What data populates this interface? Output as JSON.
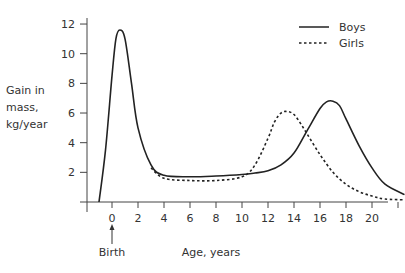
{
  "chart_data": {
    "type": "line",
    "title": "",
    "xlabel": "Age, years",
    "ylabel": "Gain in mass, kg/year",
    "ylabel_lines": [
      "Gain in",
      "mass,",
      "kg/year"
    ],
    "xlim": [
      -2,
      23
    ],
    "ylim": [
      0,
      12
    ],
    "x_ticks": [
      0,
      2,
      4,
      6,
      8,
      10,
      12,
      14,
      16,
      18,
      20
    ],
    "y_ticks": [
      2,
      4,
      6,
      8,
      10,
      12
    ],
    "grid": false,
    "legend_position": "upper right",
    "annotations": [
      {
        "text": "Birth",
        "x": 0,
        "arrow": "up"
      }
    ],
    "series": [
      {
        "name": "Boys",
        "style": "solid",
        "x": [
          -1,
          -0.5,
          0,
          0.3,
          0.6,
          1,
          1.5,
          2,
          3,
          4,
          6,
          8,
          10,
          11,
          12,
          13,
          14,
          15,
          16,
          16.5,
          17,
          17.5,
          18,
          19,
          20,
          21,
          22.5
        ],
        "y": [
          0,
          3.5,
          8.5,
          11,
          11.6,
          11,
          8,
          5,
          2.5,
          1.8,
          1.7,
          1.75,
          1.85,
          1.95,
          2.1,
          2.5,
          3.3,
          4.8,
          6.3,
          6.75,
          6.8,
          6.5,
          5.6,
          3.8,
          2.3,
          1.2,
          0.5
        ]
      },
      {
        "name": "Girls",
        "style": "dashed",
        "x": [
          3,
          4,
          6,
          8,
          10,
          11,
          12,
          12.5,
          13,
          13.5,
          14,
          14.5,
          15,
          16,
          17,
          18,
          19,
          20,
          21,
          22.5
        ],
        "y": [
          2.3,
          1.6,
          1.45,
          1.45,
          1.7,
          2.5,
          4.3,
          5.4,
          6.0,
          6.1,
          5.9,
          5.3,
          4.6,
          3.2,
          2.0,
          1.2,
          0.7,
          0.4,
          0.2,
          0.15
        ]
      }
    ]
  },
  "legend": {
    "boys": "Boys",
    "girls": "Girls"
  },
  "annotation": {
    "birth": "Birth"
  },
  "axis": {
    "xlabel": "Age, years",
    "ylabel": [
      "Gain in",
      "mass,",
      "kg/year"
    ],
    "x_ticks": [
      "0",
      "2",
      "4",
      "6",
      "8",
      "10",
      "12",
      "14",
      "16",
      "18",
      "20"
    ],
    "y_ticks": [
      "2",
      "4",
      "6",
      "8",
      "10",
      "12"
    ]
  }
}
